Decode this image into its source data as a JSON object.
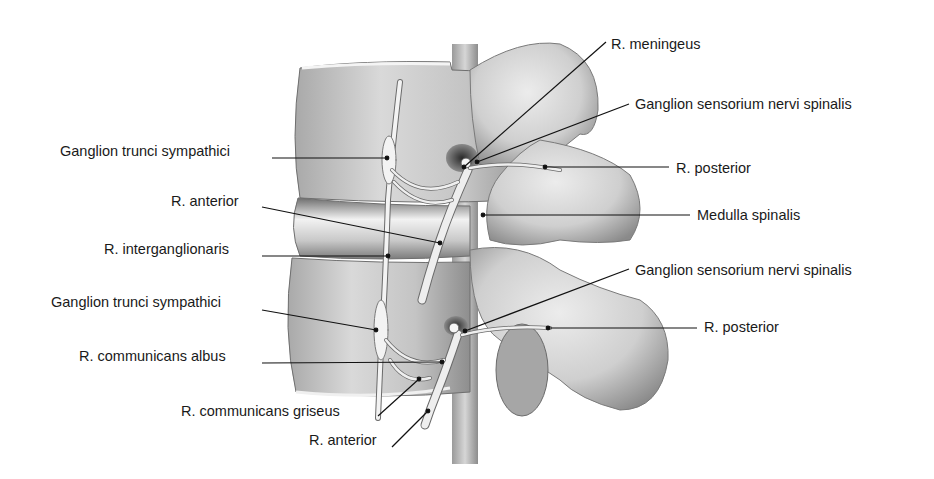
{
  "figure": {
    "type": "anatomical-illustration",
    "colors": {
      "background": "#ffffff",
      "bone_light": "#e2e2e2",
      "bone_mid": "#bdbdbd",
      "bone_dark": "#7a7a7a",
      "nerve": "#efefef",
      "leader_line": "#111111",
      "text": "#1a1a1a"
    }
  },
  "labels_left": [
    {
      "id": "ganglion-trunci-sympathici-upper",
      "text": "Ganglion trunci sympathici",
      "x": 60,
      "y": 151,
      "tip": [
        387,
        158
      ]
    },
    {
      "id": "r-anterior-upper",
      "text": "R. anterior",
      "x": 171,
      "y": 201,
      "tip": [
        440,
        243
      ]
    },
    {
      "id": "r-interganglionaris",
      "text": "R. interganglionaris",
      "x": 104,
      "y": 249,
      "tip": [
        388,
        256
      ]
    },
    {
      "id": "ganglion-trunci-sympathici-lower",
      "text": "Ganglion trunci sympathici",
      "x": 51,
      "y": 302,
      "tip": [
        376,
        330
      ]
    },
    {
      "id": "r-communicans-albus",
      "text": "R. communicans albus",
      "x": 79,
      "y": 356,
      "tip": [
        442,
        362
      ]
    },
    {
      "id": "r-communicans-griseus",
      "text": "R. communicans griseus",
      "x": 181,
      "y": 411,
      "tip": [
        419,
        379
      ]
    },
    {
      "id": "r-anterior-lower",
      "text": "R. anterior",
      "x": 309,
      "y": 440,
      "tip": [
        428,
        411
      ]
    }
  ],
  "labels_right": [
    {
      "id": "r-meningeus",
      "text": "R. meningeus",
      "x": 611,
      "y": 36,
      "tip": [
        464,
        167
      ]
    },
    {
      "id": "ganglion-sensorium-upper",
      "text": "Ganglion sensorium nervi spinalis",
      "x": 635,
      "y": 96,
      "tip": [
        477,
        162
      ]
    },
    {
      "id": "r-posterior-upper",
      "text": "R. posterior",
      "x": 676,
      "y": 160,
      "tip": [
        545,
        167
      ]
    },
    {
      "id": "medulla-spinalis",
      "text": "Medulla spinalis",
      "x": 697,
      "y": 207,
      "tip": [
        483,
        215
      ]
    },
    {
      "id": "ganglion-sensorium-lower",
      "text": "Ganglion sensorium nervi spinalis",
      "x": 635,
      "y": 262,
      "tip": [
        465,
        331
      ]
    },
    {
      "id": "r-posterior-lower",
      "text": "R. posterior",
      "x": 704,
      "y": 319,
      "tip": [
        548,
        328
      ]
    }
  ]
}
